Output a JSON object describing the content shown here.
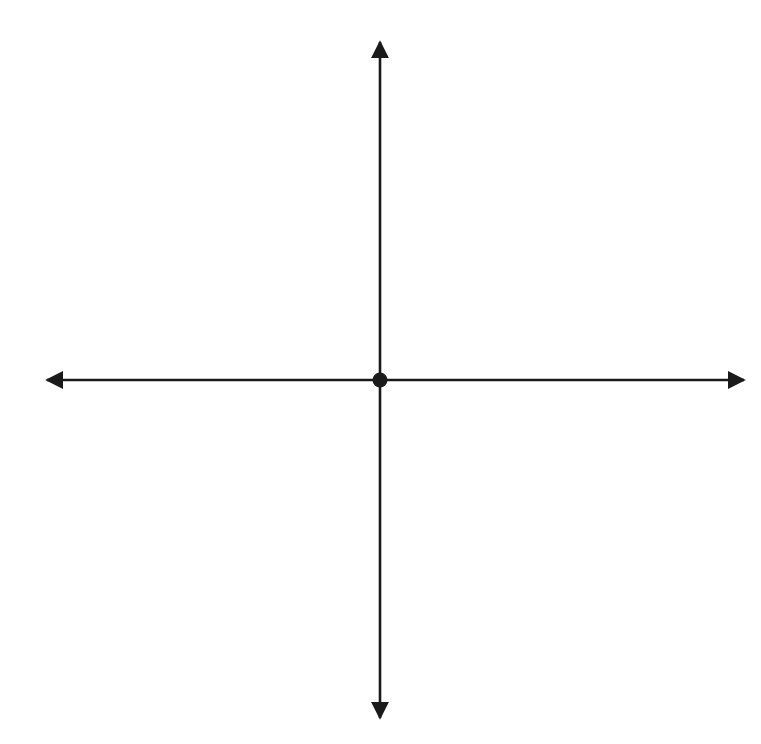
{
  "figure": {
    "kind": "coordinate-plane-dilation-diagram",
    "background_color": "#ffffff",
    "ink_color": "#1a1a1a",
    "grid_color": "#9a9a9a"
  },
  "axes": {
    "x_axis_label": "x",
    "y_axis_label": "y",
    "x_min": -10,
    "x_max": 10,
    "y_min": -10,
    "y_max": 10,
    "x_tick_labels": [
      "-10",
      "-9",
      "-8",
      "-7",
      "-6",
      "-5",
      "-4",
      "-3",
      "-2",
      "-1",
      "0",
      "1",
      "2",
      "3",
      "4",
      "5",
      "6",
      "7",
      "8",
      "9",
      "10"
    ],
    "y_tick_labels": [
      "10",
      "9",
      "8",
      "7",
      "6",
      "5",
      "4",
      "3",
      "2",
      "1",
      "-1",
      "-2",
      "-3",
      "-4",
      "-5",
      "-6",
      "-7",
      "-8",
      "-9",
      "-10"
    ],
    "origin_tick_label": "0",
    "grid_on": true,
    "grid_step": 1,
    "arrowheads": [
      "left",
      "right",
      "up",
      "down"
    ]
  },
  "chart_data": {
    "type": "scatter",
    "title": "",
    "xlabel": "x",
    "ylabel": "y",
    "xlim": [
      -10,
      10
    ],
    "ylim": [
      -10,
      10
    ],
    "grid": true,
    "series": [
      {
        "name": "Triangle GHJ (preimage)",
        "style": "solid",
        "closed": true,
        "points": [
          {
            "label": "G",
            "x": 2,
            "y": -3
          },
          {
            "label": "H",
            "x": -6,
            "y": 2
          },
          {
            "label": "J",
            "x": 0,
            "y": 4
          }
        ]
      },
      {
        "name": "Triangle G'H'J' (image)",
        "style": "dashed",
        "closed": true,
        "points": [
          {
            "label": "G'",
            "x": 1,
            "y": -1.5
          },
          {
            "label": "H'",
            "x": -3,
            "y": 1
          },
          {
            "label": "J'",
            "x": 0,
            "y": 2
          }
        ]
      }
    ],
    "center_point": {
      "label": "C",
      "x": 0,
      "y": 0,
      "marker": "filled-circle"
    }
  },
  "labels": {
    "j": {
      "name": "J",
      "coords": "(0, 4)"
    },
    "j_prime": {
      "name": "J′",
      "coords": "(0, 2)"
    },
    "h": {
      "name": "H",
      "coords": "(–6, 2)"
    },
    "h_prime": {
      "name": "H′",
      "coords": "(–3, 1)"
    },
    "g": {
      "name": "G",
      "coords": "(2, –3)"
    },
    "g_prime": {
      "name": "G′",
      "coords": "(1, –1.5)"
    },
    "center": {
      "name": "C"
    }
  }
}
